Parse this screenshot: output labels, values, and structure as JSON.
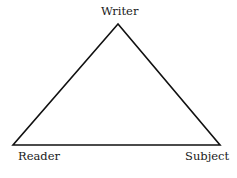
{
  "diagram": {
    "type": "triangle",
    "stroke_color": "#111111",
    "vertices": {
      "top": {
        "label": "Writer"
      },
      "bottom_left": {
        "label": "Reader"
      },
      "bottom_right": {
        "label": "Subject"
      }
    }
  }
}
